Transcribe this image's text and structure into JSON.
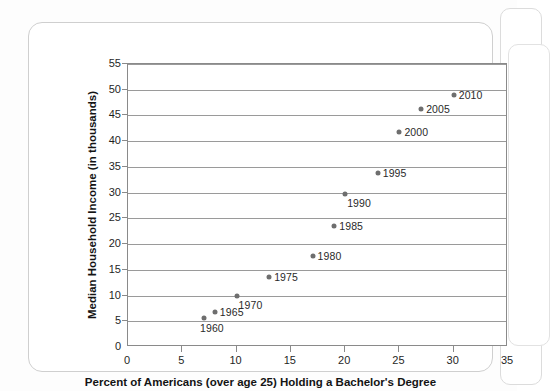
{
  "chart_data": {
    "type": "scatter",
    "title": "",
    "xlabel": "Percent of Americans (over age 25) Holding a Bachelor's Degree",
    "ylabel": "Median Household Income (in thousands)",
    "xlim": [
      0,
      35
    ],
    "ylim": [
      0,
      55
    ],
    "xticks": [
      "0",
      "5",
      "10",
      "15",
      "20",
      "25",
      "30",
      "35"
    ],
    "yticks": [
      "5",
      "10",
      "15",
      "20",
      "25",
      "30",
      "35",
      "40",
      "45",
      "50",
      "55"
    ],
    "grid": "horizontal",
    "legend": "none",
    "marker_color": "#6e6e6e",
    "points": [
      {
        "label": "1960",
        "x": 7.0,
        "y": 5.6,
        "label_pos": "below-left"
      },
      {
        "label": "1965",
        "x": 8.0,
        "y": 6.8,
        "label_pos": "right"
      },
      {
        "label": "1970",
        "x": 10.0,
        "y": 9.9,
        "label_pos": "below-right"
      },
      {
        "label": "1975",
        "x": 13.0,
        "y": 13.7,
        "label_pos": "right"
      },
      {
        "label": "1980",
        "x": 17.0,
        "y": 17.6,
        "label_pos": "right"
      },
      {
        "label": "1985",
        "x": 19.0,
        "y": 23.5,
        "label_pos": "right"
      },
      {
        "label": "1990",
        "x": 20.0,
        "y": 29.8,
        "label_pos": "below-right"
      },
      {
        "label": "1995",
        "x": 23.0,
        "y": 33.9,
        "label_pos": "right"
      },
      {
        "label": "2000",
        "x": 25.0,
        "y": 41.8,
        "label_pos": "right"
      },
      {
        "label": "2005",
        "x": 27.0,
        "y": 46.2,
        "label_pos": "right"
      },
      {
        "label": "2010",
        "x": 30.0,
        "y": 49.0,
        "label_pos": "right"
      }
    ]
  }
}
